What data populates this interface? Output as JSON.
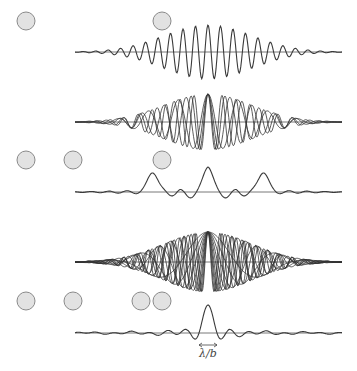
{
  "colors": {
    "slit_fill": "#e2e2e2",
    "slit_stroke": "#8a8a8a",
    "curve": "#3a3a3a",
    "axis": "#555555",
    "background": "#ffffff"
  },
  "axis": {
    "x_start": 75,
    "x_end": 342,
    "center_x": 208
  },
  "rows": [
    {
      "id": "row-1-slits",
      "type": "slits",
      "y": 21,
      "r": 9,
      "centers_x": [
        26,
        162
      ]
    },
    {
      "id": "row-1-pattern",
      "type": "single",
      "baseline_y": 52,
      "amplitude": 27,
      "fringe_period": 12.5,
      "envelope_width": 62
    },
    {
      "id": "row-2-pattern",
      "type": "overlay",
      "baseline_y": 122,
      "amplitude": 28,
      "fringe_periods": [
        14,
        17,
        22,
        30
      ],
      "envelope_width": 62
    },
    {
      "id": "row-2-slits",
      "type": "slits",
      "y": 160,
      "r": 9,
      "centers_x": [
        26,
        73,
        162
      ]
    },
    {
      "id": "row-2-sum",
      "type": "sum",
      "baseline_y": 192,
      "amplitude": 28,
      "peaks_x": [
        153,
        208,
        263
      ],
      "envelope_width": 62
    },
    {
      "id": "row-3-pattern",
      "type": "overlay",
      "baseline_y": 262,
      "amplitude": 30,
      "fringe_periods": [
        12,
        14,
        17,
        20,
        24,
        30,
        38,
        50,
        70,
        110
      ],
      "envelope_width": 62
    },
    {
      "id": "row-3-slits",
      "type": "slits",
      "y": 301,
      "r": 9,
      "centers_x": [
        26,
        73,
        141,
        162
      ]
    },
    {
      "id": "row-3-sum",
      "type": "sinc",
      "baseline_y": 333,
      "amplitude": 28,
      "main_half_width": 9
    }
  ],
  "annotation": {
    "text": "λ/b",
    "arrow_x1": 199,
    "arrow_x2": 217,
    "arrow_y": 345,
    "text_x": 199,
    "text_y": 347
  }
}
